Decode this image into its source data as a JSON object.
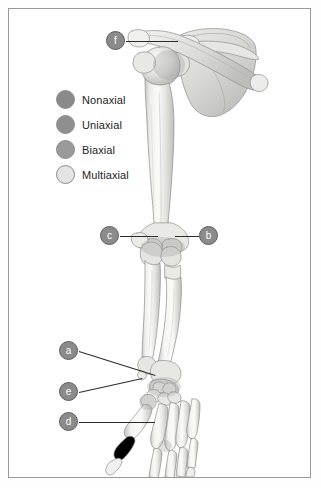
{
  "figure": {
    "background_color": "#ffffff",
    "border_color": "#9a9a9a"
  },
  "legend": {
    "items": [
      {
        "label": "Nonaxial",
        "color": "#8a8a8a"
      },
      {
        "label": "Uniaxial",
        "color": "#8f8f8f"
      },
      {
        "label": "Biaxial",
        "color": "#9a9a9a"
      },
      {
        "label": "Multiaxial",
        "color": "#e4e4e4"
      }
    ]
  },
  "callouts": [
    {
      "id": "f",
      "label": "f",
      "x": 106,
      "y": 31,
      "target": "shoulder joint",
      "leader": {
        "x1": 126,
        "y1": 41,
        "x2": 178,
        "y2": 41
      }
    },
    {
      "id": "c",
      "label": "c",
      "x": 100,
      "y": 226,
      "target": "elbow joint, medial side",
      "leader": {
        "x1": 120,
        "y1": 236,
        "x2": 158,
        "y2": 236
      }
    },
    {
      "id": "b",
      "label": "b",
      "x": 199,
      "y": 226,
      "target": "elbow joint, lateral side",
      "leader": {
        "x1": 175,
        "y1": 236,
        "x2": 199,
        "y2": 236
      }
    },
    {
      "id": "a",
      "label": "a",
      "x": 59,
      "y": 341,
      "target": "carpal region",
      "leader": {
        "x1": 79,
        "y1": 351,
        "x2": 155,
        "y2": 375
      }
    },
    {
      "id": "e",
      "label": "e",
      "x": 59,
      "y": 382,
      "target": "thumb carpometacarpal joint",
      "leader": {
        "x1": 79,
        "y1": 392,
        "x2": 142,
        "y2": 378
      }
    },
    {
      "id": "d",
      "label": "d",
      "x": 59,
      "y": 412,
      "target": "metacarpophalangeal joint",
      "leader": {
        "x1": 79,
        "y1": 422,
        "x2": 155,
        "y2": 422
      }
    }
  ],
  "bone_art": {
    "fill_light": "#f2f2f0",
    "fill_mid": "#d8d8d6",
    "fill_shadow": "#b9b9b7",
    "outline": "#8e8e8c",
    "regions": [
      "scapula",
      "clavicle",
      "humerus",
      "radius",
      "ulna",
      "carpals",
      "metacarpals",
      "phalanges"
    ]
  }
}
